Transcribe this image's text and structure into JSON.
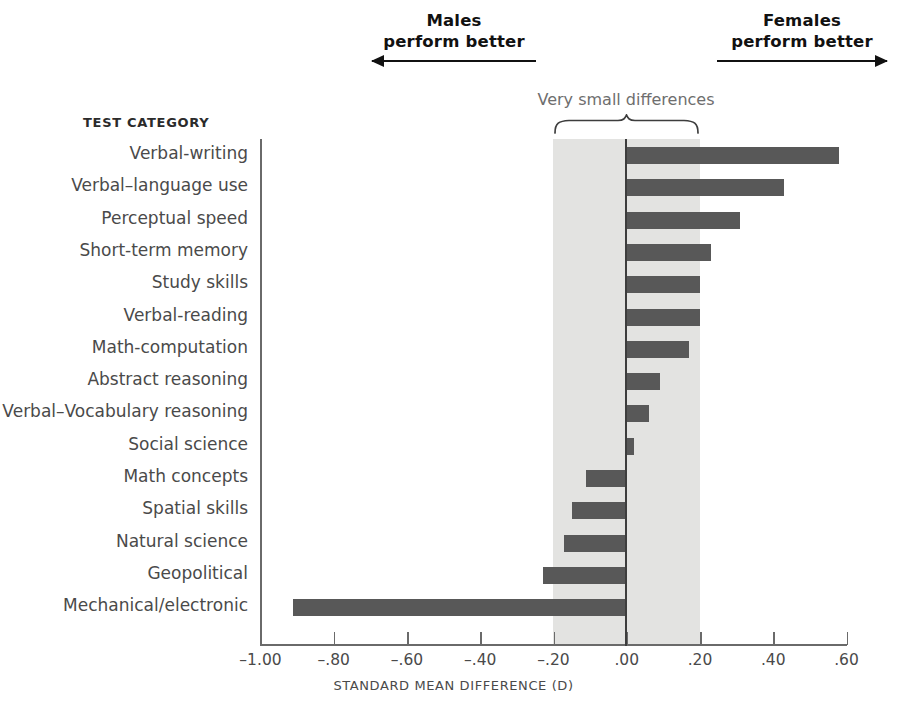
{
  "header": {
    "males": "Males\nperform better",
    "males_line1": "Males",
    "males_line2": "perform better",
    "females_line1": "Females",
    "females_line2": "perform better",
    "band_caption": "Very small differences",
    "category_header": "TEST CATEGORY"
  },
  "colors": {
    "bar": "#585858",
    "band": "#e3e3e1",
    "axis": "#6a6a6a",
    "text": "#4a4a4a",
    "arrow": "#111111"
  },
  "chart_data": {
    "type": "bar",
    "orientation": "horizontal",
    "title": "",
    "xlabel": "STANDARD MEAN DIFFERENCE (D)",
    "ylabel": "TEST CATEGORY",
    "xlim": [
      -1.0,
      0.6
    ],
    "xticks": [
      -1.0,
      -0.8,
      -0.6,
      -0.4,
      -0.2,
      0.0,
      0.2,
      0.4,
      0.6
    ],
    "xticklabels": [
      "–1.00",
      "–.80",
      "–.60",
      "–.40",
      "–.20",
      ".00",
      ".20",
      ".40",
      ".60"
    ],
    "grid": false,
    "legend": null,
    "zero_line": 0.0,
    "shaded_band": {
      "from": -0.2,
      "to": 0.2,
      "label": "Very small differences"
    },
    "annotations": [
      {
        "text": "Males perform better",
        "direction": "left"
      },
      {
        "text": "Females perform better",
        "direction": "right"
      }
    ],
    "categories": [
      "Verbal-writing",
      "Verbal–language use",
      "Perceptual speed",
      "Short-term memory",
      "Study skills",
      "Verbal-reading",
      "Math-computation",
      "Abstract reasoning",
      "Verbal–Vocabulary reasoning",
      "Social science",
      "Math concepts",
      "Spatial skills",
      "Natural science",
      "Geopolitical",
      "Mechanical/electronic"
    ],
    "values": [
      0.58,
      0.43,
      0.31,
      0.23,
      0.2,
      0.2,
      0.17,
      0.09,
      0.06,
      0.02,
      -0.11,
      -0.15,
      -0.17,
      -0.23,
      -0.91
    ]
  }
}
